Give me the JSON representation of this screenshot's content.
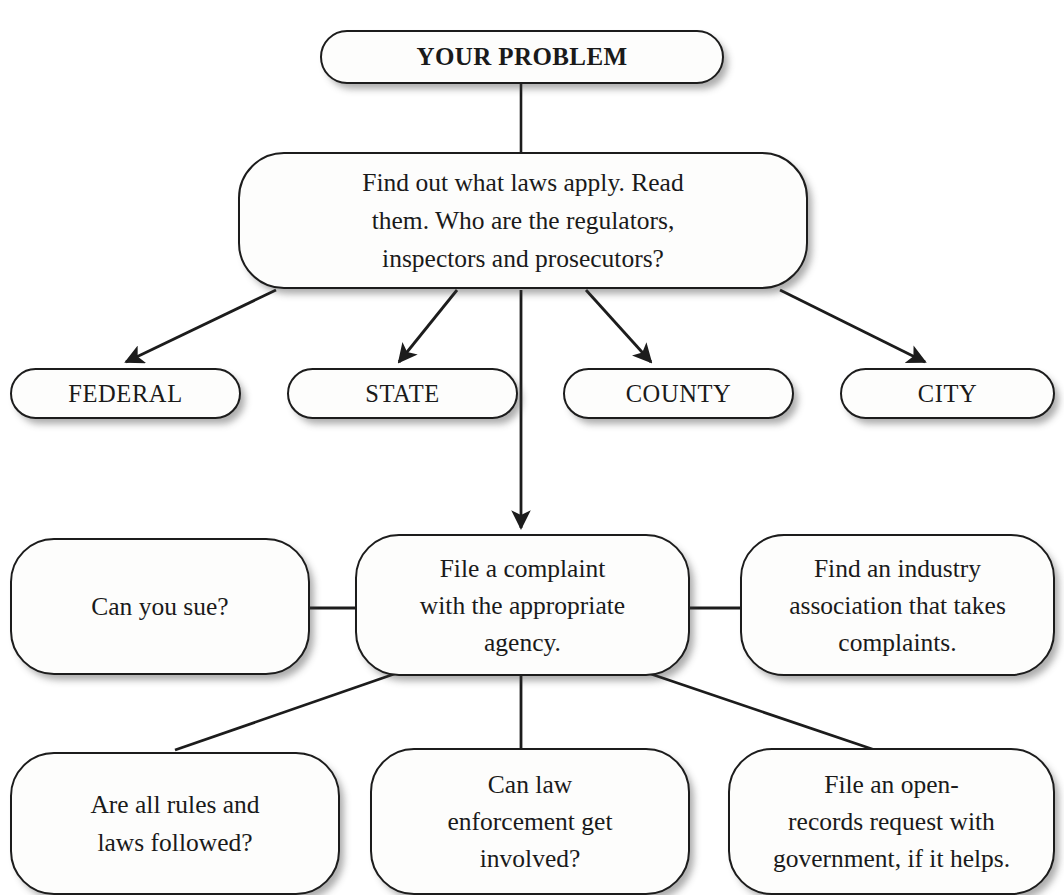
{
  "diagram": {
    "line_color": "#1c1c1c",
    "box_fill": "#fdfdfc",
    "text_color": "#1a1a1a",
    "nodes": {
      "problem": {
        "label": "YOUR PROBLEM"
      },
      "find_laws": {
        "label": "Find out what laws apply. Read\nthem. Who are the regulators,\ninspectors and prosecutors?"
      },
      "federal": {
        "label": "FEDERAL"
      },
      "state": {
        "label": "STATE"
      },
      "county": {
        "label": "COUNTY"
      },
      "city": {
        "label": "CITY"
      },
      "can_you_sue": {
        "label": "Can you sue?"
      },
      "file_complaint": {
        "label": "File a complaint\nwith the appropriate\nagency."
      },
      "industry_association": {
        "label": "Find an industry\nassociation that takes\ncomplaints."
      },
      "rules_followed": {
        "label": "Are all rules and\nlaws followed?"
      },
      "law_enforcement": {
        "label": "Can law\nenforcement get\ninvolved?"
      },
      "open_records": {
        "label": "File an open-\nrecords request with\ngovernment, if it helps."
      }
    },
    "edges": [
      {
        "from": "problem",
        "to": "find_laws",
        "arrow": false
      },
      {
        "from": "find_laws",
        "to": "federal",
        "arrow": true
      },
      {
        "from": "find_laws",
        "to": "state",
        "arrow": true
      },
      {
        "from": "find_laws",
        "to": "county",
        "arrow": true
      },
      {
        "from": "find_laws",
        "to": "city",
        "arrow": true
      },
      {
        "from": "find_laws",
        "to": "file_complaint",
        "arrow": true
      },
      {
        "from": "can_you_sue",
        "to": "file_complaint",
        "arrow": false
      },
      {
        "from": "file_complaint",
        "to": "industry_association",
        "arrow": false
      },
      {
        "from": "file_complaint",
        "to": "rules_followed",
        "arrow": false
      },
      {
        "from": "file_complaint",
        "to": "law_enforcement",
        "arrow": false
      },
      {
        "from": "file_complaint",
        "to": "open_records",
        "arrow": false
      }
    ]
  }
}
